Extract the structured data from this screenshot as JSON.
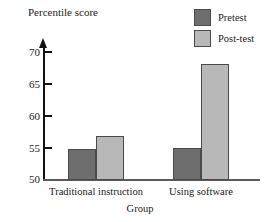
{
  "chart_data": {
    "type": "bar",
    "title": "",
    "xlabel": "Group",
    "ylabel": "Percentile score",
    "categories": [
      "Traditional instruction",
      "Using software"
    ],
    "series": [
      {
        "name": "Pretest",
        "values": [
          54.8,
          55
        ],
        "color": "#6e6e6e"
      },
      {
        "name": "Post-test",
        "values": [
          56.8,
          68
        ],
        "color": "#b8b8b8"
      }
    ],
    "ylim": [
      50,
      72
    ],
    "yticks": [
      50,
      55,
      60,
      65,
      70
    ],
    "ytick_labels": [
      "50",
      "55",
      "60",
      "65",
      "70"
    ],
    "grid": false,
    "legend_position": "top-right"
  },
  "axes": {
    "y_title": "Percentile score",
    "x_title": "Group",
    "tick_50": "50",
    "tick_55": "55",
    "tick_60": "60",
    "tick_65": "65",
    "tick_70": "70"
  },
  "categories": {
    "cat_0": "Traditional instruction",
    "cat_1": "Using software"
  },
  "legend": {
    "items": [
      {
        "label": "Pretest"
      },
      {
        "label": "Post-test"
      }
    ]
  },
  "colors": {
    "pretest": "#6e6e6e",
    "posttest": "#b8b8b8",
    "axis": "#111111",
    "baseline": "#5a5a5a",
    "background": "#ffffff"
  }
}
